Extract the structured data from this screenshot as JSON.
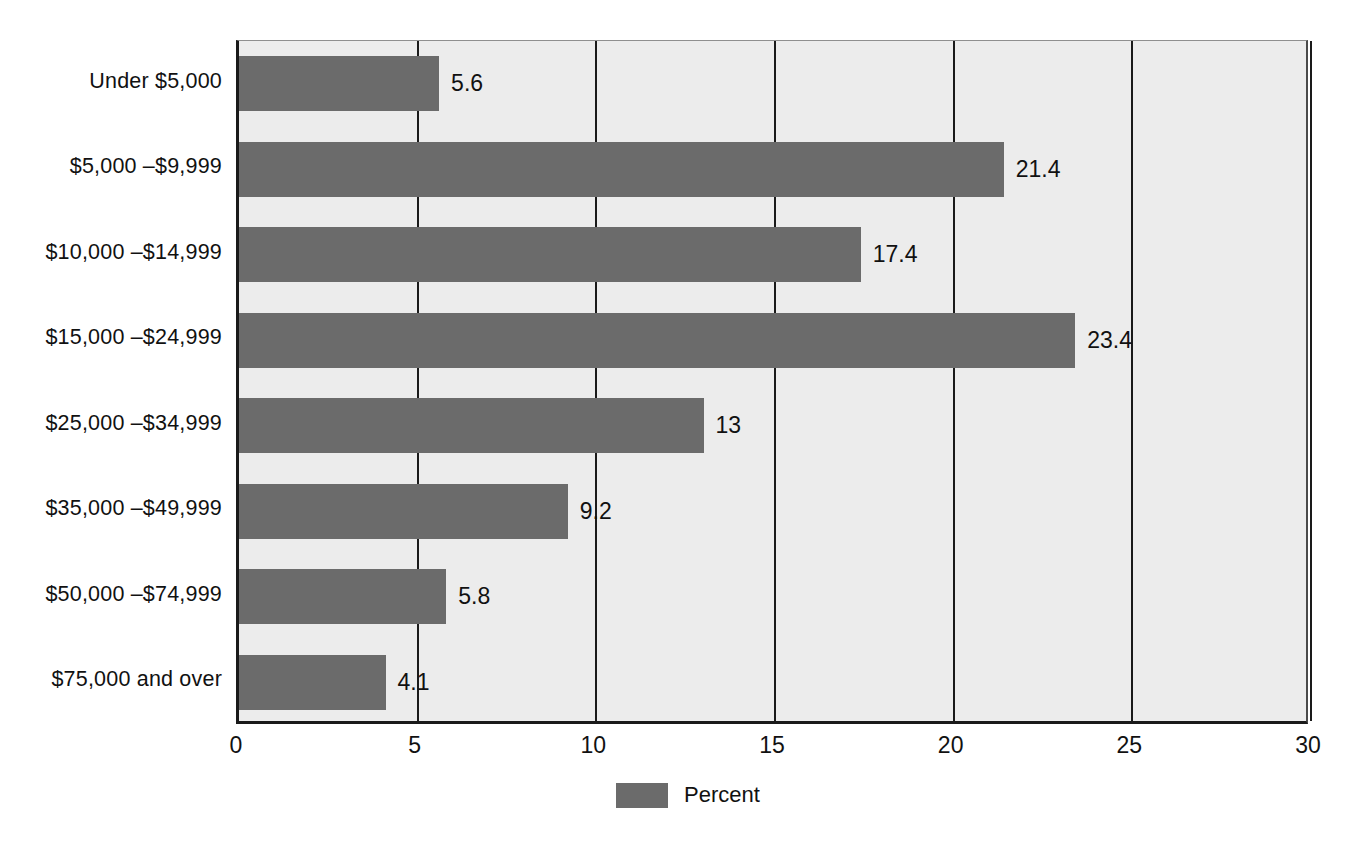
{
  "chart_data": {
    "type": "bar",
    "orientation": "horizontal",
    "title": "",
    "subtitle": "",
    "xlabel": "",
    "ylabel": "",
    "xlim": [
      0,
      30
    ],
    "xticks": [
      "0",
      "5",
      "10",
      "15",
      "20",
      "25",
      "30"
    ],
    "xtick_values": [
      0,
      5,
      10,
      15,
      20,
      25,
      30
    ],
    "grid": "vertical",
    "legend": {
      "position": "bottom-center",
      "entries": [
        {
          "label": "Percent",
          "color": "#6b6b6b"
        }
      ]
    },
    "categories": [
      "Under $5,000",
      "$5,000 –$9,999",
      "$10,000 –$14,999",
      "$15,000 –$24,999",
      "$25,000 –$34,999",
      "$35,000 –$49,999",
      "$50,000 –$74,999",
      "$75,000 and over"
    ],
    "series": [
      {
        "name": "Percent",
        "color": "#6b6b6b",
        "values": [
          5.6,
          21.4,
          17.4,
          23.4,
          13,
          9.2,
          5.8,
          4.1
        ],
        "labels": [
          "5.6",
          "21.4",
          "17.4",
          "23.4",
          "13",
          "9.2",
          "5.8",
          "4.1"
        ]
      }
    ]
  },
  "style": {
    "bar_color": "#6b6b6b",
    "plot_background": "#ececec",
    "page_background": "#ffffff",
    "axis_color": "#1a1a1a",
    "text_color": "#111111"
  }
}
